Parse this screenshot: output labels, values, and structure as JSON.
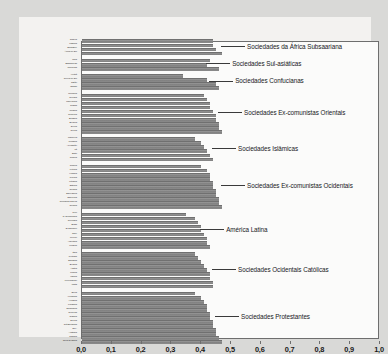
{
  "chart_data": {
    "type": "bar",
    "orientation": "horizontal",
    "title": "",
    "subtitle": "",
    "xlabel": "",
    "ylabel": "",
    "xlim": [
      0.0,
      1.0
    ],
    "grid": false,
    "legend": "none",
    "bar_color": "#8d8d8d",
    "decimal_separator": ",",
    "xticks": [
      {
        "value": 0.0,
        "label": "0,0"
      },
      {
        "value": 0.1,
        "label": "0,1"
      },
      {
        "value": 0.2,
        "label": "0,2"
      },
      {
        "value": 0.3,
        "label": "0,3"
      },
      {
        "value": 0.4,
        "label": "0,4"
      },
      {
        "value": 0.5,
        "label": "0,5"
      },
      {
        "value": 0.6,
        "label": "0,6"
      },
      {
        "value": 0.7,
        "label": "0,7"
      },
      {
        "value": 0.8,
        "label": "0,8"
      },
      {
        "value": 0.9,
        "label": "0,9"
      },
      {
        "value": 1.0,
        "label": "1,0"
      }
    ],
    "groups": [
      {
        "annotation": "Sociedades da África Subsaariana",
        "annotation_value_x": 0.47,
        "items": [
          {
            "label": "Nigéria",
            "value": 0.44
          },
          {
            "label": "Uganda",
            "value": 0.44
          },
          {
            "label": "Zimbábue",
            "value": 0.45
          },
          {
            "label": "África do Sul",
            "value": 0.47
          }
        ]
      },
      {
        "annotation": "Sociedades Sul-asiáticas",
        "annotation_value_x": 0.42,
        "items": [
          {
            "label": "Índia",
            "value": 0.43
          },
          {
            "label": "Bangladesh",
            "value": 0.42
          },
          {
            "label": "Indonésia",
            "value": 0.46
          }
        ]
      },
      {
        "annotation": "Sociedades Confucianas",
        "annotation_value_x": 0.43,
        "items": [
          {
            "label": "Vietnã",
            "value": 0.34
          },
          {
            "label": "Coreia do Sul",
            "value": 0.42
          },
          {
            "label": "Japão",
            "value": 0.45
          },
          {
            "label": "Taiwan",
            "value": 0.46
          }
        ]
      },
      {
        "annotation": "Sociedades Ex-comunistas Orientais",
        "annotation_value_x": 0.46,
        "items": [
          {
            "label": "Moldávia",
            "value": 0.41
          },
          {
            "label": "Geórgia",
            "value": 0.42
          },
          {
            "label": "Macedônia",
            "value": 0.43
          },
          {
            "label": "Rússia",
            "value": 0.43
          },
          {
            "label": "Ucrânia",
            "value": 0.44
          },
          {
            "label": "Romênia",
            "value": 0.45
          },
          {
            "label": "Bulgária",
            "value": 0.45
          },
          {
            "label": "Belarus",
            "value": 0.46
          },
          {
            "label": "Sérvia",
            "value": 0.46
          },
          {
            "label": "Grécia",
            "value": 0.47
          }
        ]
      },
      {
        "annotation": "Sociedades Islâmicas",
        "annotation_value_x": 0.44,
        "items": [
          {
            "label": "Marrocos",
            "value": 0.38
          },
          {
            "label": "Jordânia",
            "value": 0.4
          },
          {
            "label": "Azerbaijão",
            "value": 0.41
          },
          {
            "label": "Irã",
            "value": 0.42
          },
          {
            "label": "Egito",
            "value": 0.43
          },
          {
            "label": "Turquia",
            "value": 0.44
          }
        ]
      },
      {
        "annotation": "Sociedades Ex-comunistas Ocidentais",
        "annotation_value_x": 0.47,
        "items": [
          {
            "label": "Turquia",
            "value": 0.4
          },
          {
            "label": "Letônia",
            "value": 0.42
          },
          {
            "label": "Hungria",
            "value": 0.43
          },
          {
            "label": "Polônia",
            "value": 0.43
          },
          {
            "label": "Lituânia",
            "value": 0.44
          },
          {
            "label": "Estônia",
            "value": 0.44
          },
          {
            "label": "Croácia",
            "value": 0.45
          },
          {
            "label": "Eslováquia",
            "value": 0.45
          },
          {
            "label": "Eslovênia",
            "value": 0.46
          },
          {
            "label": "República Tcheca",
            "value": 0.46
          },
          {
            "label": "Croácia",
            "value": 0.47
          }
        ]
      },
      {
        "annotation": "América Latina",
        "annotation_value_x": 0.4,
        "items": [
          {
            "label": "Peru",
            "value": 0.35
          },
          {
            "label": "R. Dominicana",
            "value": 0.38
          },
          {
            "label": "Colômbia",
            "value": 0.39
          },
          {
            "label": "Brasil",
            "value": 0.4
          },
          {
            "label": "El Salvador",
            "value": 0.4
          },
          {
            "label": "Chile",
            "value": 0.41
          },
          {
            "label": "México",
            "value": 0.42
          },
          {
            "label": "Argentina",
            "value": 0.42
          },
          {
            "label": "Uruguai",
            "value": 0.43
          }
        ]
      },
      {
        "annotation": "Sociedades Ocidentais Católicas",
        "annotation_value_x": 0.44,
        "items": [
          {
            "label": "Itália",
            "value": 0.38
          },
          {
            "label": "Portugal",
            "value": 0.39
          },
          {
            "label": "Espanha",
            "value": 0.4
          },
          {
            "label": "Bélgica",
            "value": 0.41
          },
          {
            "label": "Áustria",
            "value": 0.42
          },
          {
            "label": "França",
            "value": 0.43
          },
          {
            "label": "Irlanda",
            "value": 0.43
          },
          {
            "label": "Luxemburgo",
            "value": 0.44
          },
          {
            "label": "Malta",
            "value": 0.44
          }
        ]
      },
      {
        "annotation": "Sociedades Protestantes",
        "annotation_value_x": 0.45,
        "items": [
          {
            "label": "Suíça",
            "value": 0.38
          },
          {
            "label": "Alemanha",
            "value": 0.4
          },
          {
            "label": "Holanda",
            "value": 0.41
          },
          {
            "label": "Finlândia",
            "value": 0.42
          },
          {
            "label": "Dinamarca",
            "value": 0.42
          },
          {
            "label": "Noruega",
            "value": 0.43
          },
          {
            "label": "Islândia",
            "value": 0.43
          },
          {
            "label": "Suécia",
            "value": 0.44
          },
          {
            "label": "Grã-Bretanha",
            "value": 0.44
          },
          {
            "label": "EUA",
            "value": 0.45
          },
          {
            "label": "Austrália",
            "value": 0.45
          },
          {
            "label": "Canadá",
            "value": 0.46
          },
          {
            "label": "Nova Zelândia",
            "value": 0.47
          }
        ]
      }
    ]
  }
}
